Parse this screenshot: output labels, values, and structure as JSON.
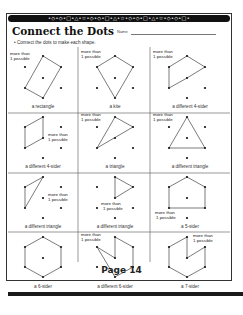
{
  "header": {
    "border_pattern": "•◇•◇•□•△•☆•◇•◇•□•△•☆•◇•◇•□•△•☆•◇•◇•□•",
    "title": "Connect the Dots",
    "name_label": "Name",
    "instruction": "• Connect the dots to make each shape."
  },
  "hint_text": [
    "more than",
    "1 possible"
  ],
  "cells": [
    {
      "label": "a rectangle",
      "hint": true
    },
    {
      "label": "a kite",
      "hint": true
    },
    {
      "label": "a different 4-sider",
      "hint": true
    },
    {
      "label": "a different 4-sider",
      "hint": true
    },
    {
      "label": "a triangle",
      "hint": true
    },
    {
      "label": "a different triangle",
      "hint": true
    },
    {
      "label": "a different triangle",
      "hint": true
    },
    {
      "label": "a different triangle",
      "hint": true
    },
    {
      "label": "a 5-sider",
      "hint": true
    },
    {
      "label": "a 6-sider",
      "hint": false
    },
    {
      "label": "a different 6-sider",
      "hint": true
    },
    {
      "label": "a 7-sider",
      "hint": true
    }
  ],
  "footer": {
    "page": "Page 14"
  },
  "colors": {
    "ink": "#222222",
    "border": "#333333",
    "bar": "#111111"
  }
}
